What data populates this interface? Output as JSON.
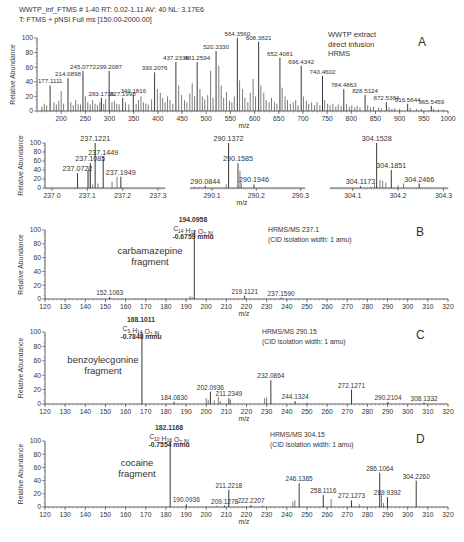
{
  "header": {
    "line1": "WWTP_inf_FTMS # 1-40 RT: 0.02-1.11 AV: 40 NL: 3.17E6",
    "line2": "T: FTMS + pNSI Full ms [150.00-2000.00]"
  },
  "chart_data": [
    {
      "id": "A",
      "type": "bar",
      "panel_label": "A",
      "annotation": [
        "WWTP extract",
        "direct infusion",
        "HRMS"
      ],
      "xlabel": "m/z",
      "ylabel": "Relative Abundance",
      "xlim": [
        150,
        1000
      ],
      "ylim": [
        0,
        100
      ],
      "xticks": [
        200,
        250,
        300,
        350,
        400,
        450,
        500,
        550,
        600,
        650,
        700,
        750,
        800,
        850,
        900,
        950,
        1000
      ],
      "yticks": [
        0,
        20,
        40,
        60,
        80,
        100
      ],
      "labeled_peaks": [
        {
          "mz": 177.1111,
          "y": 35,
          "label": "177.1111"
        },
        {
          "mz": 214.0898,
          "y": 45,
          "label": "214.0898"
        },
        {
          "mz": 245.0772,
          "y": 55,
          "label": "245.0772"
        },
        {
          "mz": 283.1736,
          "y": 18,
          "label": "283.1736"
        },
        {
          "mz": 299.2087,
          "y": 55,
          "label": "299.2087"
        },
        {
          "mz": 327.1998,
          "y": 18,
          "label": "327.1998"
        },
        {
          "mz": 349.1816,
          "y": 22,
          "label": "349.1816"
        },
        {
          "mz": 393.2076,
          "y": 53,
          "label": "393.2076"
        },
        {
          "mz": 437.2335,
          "y": 67,
          "label": "437.2335"
        },
        {
          "mz": 481.2594,
          "y": 67,
          "label": "481.2594"
        },
        {
          "mz": 520.333,
          "y": 82,
          "label": "520.3330"
        },
        {
          "mz": 564.356,
          "y": 100,
          "label": "564.3560"
        },
        {
          "mz": 608.3821,
          "y": 95,
          "label": "608.3821"
        },
        {
          "mz": 652.4081,
          "y": 73,
          "label": "652.4081"
        },
        {
          "mz": 696.4342,
          "y": 62,
          "label": "696.4342"
        },
        {
          "mz": 740.4602,
          "y": 48,
          "label": "740.4602"
        },
        {
          "mz": 784.4863,
          "y": 30,
          "label": "784.4863"
        },
        {
          "mz": 828.5124,
          "y": 22,
          "label": "828.5124"
        },
        {
          "mz": 872.5384,
          "y": 12,
          "label": "872.5384"
        },
        {
          "mz": 916.5644,
          "y": 10,
          "label": "916.5644"
        },
        {
          "mz": 965.5459,
          "y": 7,
          "label": "965.5459"
        }
      ],
      "minor_peaks": [
        [
          160,
          6
        ],
        [
          165,
          10
        ],
        [
          170,
          8
        ],
        [
          185,
          12
        ],
        [
          190,
          9
        ],
        [
          195,
          14
        ],
        [
          200,
          27
        ],
        [
          205,
          10
        ],
        [
          220,
          12
        ],
        [
          225,
          8
        ],
        [
          230,
          15
        ],
        [
          235,
          10
        ],
        [
          240,
          9
        ],
        [
          250,
          20
        ],
        [
          255,
          12
        ],
        [
          260,
          9
        ],
        [
          265,
          15
        ],
        [
          270,
          10
        ],
        [
          275,
          8
        ],
        [
          280,
          12
        ],
        [
          288,
          10
        ],
        [
          292,
          16
        ],
        [
          305,
          12
        ],
        [
          310,
          14
        ],
        [
          315,
          10
        ],
        [
          320,
          9
        ],
        [
          333,
          12
        ],
        [
          340,
          9
        ],
        [
          355,
          10
        ],
        [
          360,
          15
        ],
        [
          365,
          20
        ],
        [
          370,
          12
        ],
        [
          375,
          10
        ],
        [
          380,
          9
        ],
        [
          387,
          16
        ],
        [
          399,
          30
        ],
        [
          405,
          25
        ],
        [
          410,
          18
        ],
        [
          415,
          12
        ],
        [
          420,
          20
        ],
        [
          425,
          15
        ],
        [
          431,
          10
        ],
        [
          443,
          35
        ],
        [
          449,
          22
        ],
        [
          455,
          15
        ],
        [
          460,
          12
        ],
        [
          466,
          24
        ],
        [
          471,
          38
        ],
        [
          476,
          20
        ],
        [
          487,
          30
        ],
        [
          492,
          20
        ],
        [
          497,
          16
        ],
        [
          503,
          22
        ],
        [
          509,
          55
        ],
        [
          514,
          18
        ],
        [
          526,
          62
        ],
        [
          531,
          35
        ],
        [
          536,
          18
        ],
        [
          542,
          26
        ],
        [
          548,
          14
        ],
        [
          553,
          12
        ],
        [
          558,
          20
        ],
        [
          569,
          42
        ],
        [
          575,
          30
        ],
        [
          580,
          18
        ],
        [
          586,
          12
        ],
        [
          591,
          25
        ],
        [
          597,
          44
        ],
        [
          602,
          20
        ],
        [
          613,
          35
        ],
        [
          619,
          25
        ],
        [
          624,
          15
        ],
        [
          630,
          12
        ],
        [
          635,
          18
        ],
        [
          641,
          12
        ],
        [
          646,
          10
        ],
        [
          657,
          32
        ],
        [
          663,
          20
        ],
        [
          668,
          15
        ],
        [
          674,
          10
        ],
        [
          680,
          12
        ],
        [
          685,
          15
        ],
        [
          690,
          8
        ],
        [
          701,
          20
        ],
        [
          707,
          14
        ],
        [
          712,
          10
        ],
        [
          718,
          12
        ],
        [
          724,
          8
        ],
        [
          729,
          12
        ],
        [
          735,
          8
        ],
        [
          745,
          15
        ],
        [
          751,
          10
        ],
        [
          756,
          8
        ],
        [
          762,
          10
        ],
        [
          768,
          6
        ],
        [
          773,
          9
        ],
        [
          779,
          7
        ],
        [
          790,
          10
        ],
        [
          796,
          6
        ],
        [
          801,
          8
        ],
        [
          807,
          5
        ],
        [
          812,
          7
        ],
        [
          818,
          5
        ],
        [
          834,
          8
        ],
        [
          840,
          5
        ],
        [
          846,
          6
        ],
        [
          856,
          5
        ],
        [
          862,
          4
        ],
        [
          878,
          5
        ],
        [
          884,
          3
        ],
        [
          890,
          4
        ],
        [
          900,
          3
        ],
        [
          922,
          4
        ],
        [
          935,
          3
        ],
        [
          945,
          3
        ],
        [
          970,
          3
        ],
        [
          980,
          2
        ],
        [
          990,
          2
        ]
      ]
    },
    {
      "id": "A-inset-1",
      "type": "bar",
      "xlabel": "",
      "ylabel": "Relative Abundance",
      "xlim": [
        236.98,
        237.32
      ],
      "ylim": [
        0,
        100
      ],
      "xticks": [
        237.0,
        237.1,
        237.2,
        237.3
      ],
      "xtick_labels": [
        "237.0",
        "237.1",
        "237.2",
        "237.3"
      ],
      "yticks": [
        0,
        20,
        40,
        60,
        80,
        100
      ],
      "labeled_peaks": [
        {
          "mz": 237.0722,
          "y": 33,
          "label": "237.0722"
        },
        {
          "mz": 237.1085,
          "y": 55,
          "label": "237.1085"
        },
        {
          "mz": 237.1221,
          "y": 100,
          "label": "237.1221"
        },
        {
          "mz": 237.1449,
          "y": 70,
          "label": "237.1449"
        },
        {
          "mz": 237.1949,
          "y": 25,
          "label": "237.1949"
        }
      ],
      "minor_peaks": [
        [
          237.101,
          38
        ],
        [
          237.104,
          45
        ],
        [
          237.13,
          10
        ],
        [
          237.17,
          14
        ],
        [
          237.184,
          25
        ],
        [
          237.115,
          8
        ]
      ]
    },
    {
      "id": "A-inset-2",
      "type": "bar",
      "xlabel": "m/z",
      "xlim": [
        290.05,
        290.31
      ],
      "ylim": [
        0,
        100
      ],
      "xticks": [
        290.1,
        290.2,
        290.3
      ],
      "xtick_labels": [
        "290.1",
        "290.2",
        "290.3"
      ],
      "labeled_peaks": [
        {
          "mz": 290.0844,
          "y": 5,
          "label": "290.0844"
        },
        {
          "mz": 290.1372,
          "y": 100,
          "label": "290.1372"
        },
        {
          "mz": 290.1585,
          "y": 55,
          "label": "290.1585"
        },
        {
          "mz": 290.1946,
          "y": 8,
          "label": "290.1946"
        }
      ],
      "minor_peaks": [
        [
          290.132,
          8
        ],
        [
          290.163,
          38
        ],
        [
          290.166,
          12
        ],
        [
          290.06,
          3
        ],
        [
          290.07,
          2
        ]
      ]
    },
    {
      "id": "A-inset-3",
      "type": "bar",
      "xlabel": "",
      "xlim": [
        304.05,
        304.31
      ],
      "ylim": [
        0,
        100
      ],
      "xticks": [
        304.1,
        304.2,
        304.3
      ],
      "xtick_labels": [
        "304.1",
        "304.2",
        "304.3"
      ],
      "labeled_peaks": [
        {
          "mz": 304.1173,
          "y": 4,
          "label": "304.1173"
        },
        {
          "mz": 304.1528,
          "y": 100,
          "label": "304.1528"
        },
        {
          "mz": 304.1851,
          "y": 40,
          "label": "304.1851"
        },
        {
          "mz": 304.2466,
          "y": 10,
          "label": "304.2466"
        }
      ],
      "minor_peaks": [
        [
          304.148,
          8
        ],
        [
          304.16,
          18
        ],
        [
          304.166,
          16
        ],
        [
          304.173,
          12
        ],
        [
          304.2,
          6
        ],
        [
          304.212,
          10
        ],
        [
          304.14,
          3
        ]
      ]
    },
    {
      "id": "B",
      "type": "bar",
      "panel_label": "B",
      "annotation": [
        "HRMS/MS 237.1",
        "(CID isolation width: 1 amu)"
      ],
      "fragment_label": [
        "carbamazepine",
        "fragment"
      ],
      "base_peak": {
        "mz": 194.0958,
        "label": "194.0958",
        "formula": {
          "C": "14",
          "H": "12",
          "O": "2",
          "N": ""
        },
        "error": "-0.6759 mmu"
      },
      "xlabel": "m/z",
      "ylabel": "Relative Abundance",
      "xlim": [
        120,
        320
      ],
      "ylim": [
        0,
        100
      ],
      "xticks": [
        120,
        130,
        140,
        150,
        160,
        170,
        180,
        190,
        200,
        210,
        220,
        230,
        240,
        250,
        260,
        270,
        280,
        290,
        300,
        310,
        320
      ],
      "yticks": [
        0,
        20,
        40,
        60,
        80,
        100
      ],
      "labeled_peaks": [
        {
          "mz": 152.1063,
          "y": 3,
          "label": "152.1063"
        },
        {
          "mz": 194.0958,
          "y": 100,
          "label": ""
        },
        {
          "mz": 219.1121,
          "y": 5,
          "label": "219.1121"
        },
        {
          "mz": 237.159,
          "y": 2,
          "label": "237.1590"
        }
      ],
      "minor_peaks": [
        [
          192,
          4
        ],
        [
          193,
          3
        ],
        [
          165,
          1
        ],
        [
          180,
          1
        ]
      ]
    },
    {
      "id": "C",
      "type": "bar",
      "panel_label": "C",
      "annotation": [
        "HRMS/MS 290.15",
        "(CID isolation width: 1 amu)"
      ],
      "fragment_label": [
        "benzoylecgonine",
        "fragment"
      ],
      "base_peak": {
        "mz": 168.1011,
        "label": "168.1011",
        "formula": {
          "C": "9",
          "H": "14",
          "O": "2",
          "N": ""
        },
        "error": "-0.7848 mmu"
      },
      "xlabel": "m/z",
      "ylabel": "Relative Abundance",
      "xlim": [
        120,
        320
      ],
      "ylim": [
        0,
        100
      ],
      "xticks": [
        120,
        130,
        140,
        150,
        160,
        170,
        180,
        190,
        200,
        210,
        220,
        230,
        240,
        250,
        260,
        270,
        280,
        290,
        300,
        310,
        320
      ],
      "yticks": [
        0,
        20,
        40,
        60,
        80,
        100
      ],
      "labeled_peaks": [
        {
          "mz": 168.1011,
          "y": 100,
          "label": ""
        },
        {
          "mz": 184.083,
          "y": 3,
          "label": "184.0830"
        },
        {
          "mz": 202.0936,
          "y": 17,
          "label": "202.0936"
        },
        {
          "mz": 211.2349,
          "y": 8,
          "label": "211.2349"
        },
        {
          "mz": 232.0864,
          "y": 33,
          "label": "232.0864"
        },
        {
          "mz": 244.1324,
          "y": 4,
          "label": "244.1324"
        },
        {
          "mz": 272.1271,
          "y": 20,
          "label": "272.1271"
        },
        {
          "mz": 290.2104,
          "y": 3,
          "label": "290.2104"
        },
        {
          "mz": 308.1332,
          "y": 2,
          "label": "308.1332"
        }
      ],
      "minor_peaks": [
        [
          200,
          8
        ],
        [
          201,
          6
        ],
        [
          204,
          5
        ],
        [
          206,
          10
        ],
        [
          207,
          4
        ],
        [
          212,
          6
        ],
        [
          229,
          8
        ],
        [
          230,
          9
        ],
        [
          250,
          2
        ]
      ]
    },
    {
      "id": "D",
      "type": "bar",
      "panel_label": "D",
      "annotation": [
        "HRMS/MS 304.15",
        "(CID isolation width: 1 amu)"
      ],
      "fragment_label": [
        "cocaine",
        "fragment"
      ],
      "base_peak": {
        "mz": 182.1168,
        "label": "182.1168",
        "formula": {
          "C": "10",
          "H": "16",
          "O": "2",
          "N": ""
        },
        "error": "-0.7554 mmu"
      },
      "xlabel": "m/z",
      "ylabel": "Relative Abundance",
      "xlim": [
        120,
        320
      ],
      "ylim": [
        0,
        100
      ],
      "xticks": [
        120,
        130,
        140,
        150,
        160,
        170,
        180,
        190,
        200,
        210,
        220,
        230,
        240,
        250,
        260,
        270,
        280,
        290,
        300,
        310,
        320
      ],
      "yticks": [
        0,
        20,
        40,
        60,
        80,
        100
      ],
      "labeled_peaks": [
        {
          "mz": 182.1168,
          "y": 100,
          "label": ""
        },
        {
          "mz": 190.0936,
          "y": 4,
          "label": "190.0936"
        },
        {
          "mz": 209.1278,
          "y": 2,
          "label": "209.1278"
        },
        {
          "mz": 211.2218,
          "y": 26,
          "label": "211.2218"
        },
        {
          "mz": 222.2207,
          "y": 3,
          "label": "222.2207"
        },
        {
          "mz": 246.1385,
          "y": 36,
          "label": "246.1385"
        },
        {
          "mz": 258.1116,
          "y": 18,
          "label": "258.1116"
        },
        {
          "mz": 272.1273,
          "y": 10,
          "label": "272.1273"
        },
        {
          "mz": 286.1064,
          "y": 52,
          "label": "286.1064"
        },
        {
          "mz": 289.9392,
          "y": 15,
          "label": "289.9392"
        },
        {
          "mz": 304.226,
          "y": 40,
          "label": "304.2260"
        }
      ],
      "minor_peaks": [
        [
          243,
          8
        ],
        [
          244,
          10
        ],
        [
          262,
          12
        ],
        [
          276,
          4
        ],
        [
          287,
          20
        ],
        [
          288,
          6
        ],
        [
          205,
          2
        ],
        [
          228,
          2
        ]
      ]
    }
  ]
}
